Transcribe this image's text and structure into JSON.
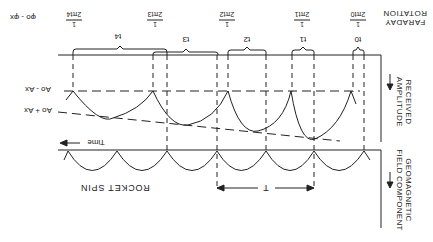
{
  "orientation": "rotated-180",
  "colors": {
    "ink": "#222222",
    "background": "#ffffff"
  },
  "faraday": {
    "title_line1": "FARADAY",
    "title_line2": "ROTATION",
    "phase_label": "φo - φx",
    "fractions": [
      {
        "num": "1",
        "den": "2πt0"
      },
      {
        "num": "1",
        "den": "2πt1"
      },
      {
        "num": "1",
        "den": "2πt2"
      },
      {
        "num": "1",
        "den": "2πt3"
      },
      {
        "num": "1",
        "den": "2πt4"
      }
    ],
    "intervals": [
      "t0",
      "t1",
      "t2",
      "t3",
      "t4"
    ]
  },
  "amplitude": {
    "title_line1": "RECEIVED",
    "title_line2": "AMPLITUDE",
    "upper_level": "Ao - Ax",
    "lower_level": "Ao + Ax",
    "time_label": "Time"
  },
  "geomagnetic": {
    "title_line1": "GEOMAGNETIC",
    "title_line2": "FIELD COMPONENT",
    "period_label": "T",
    "caption": "ROCKET SPIN"
  }
}
